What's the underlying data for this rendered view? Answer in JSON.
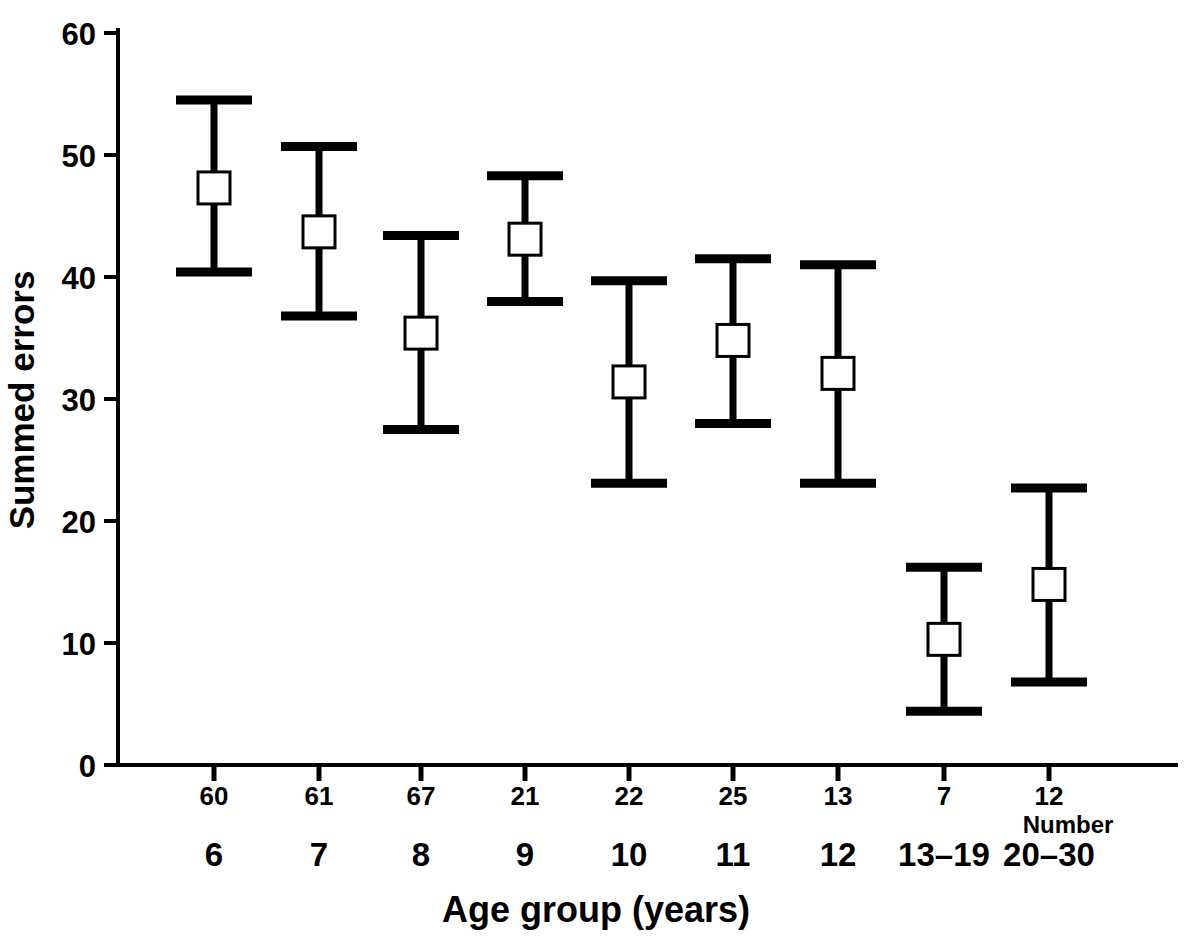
{
  "chart_data": {
    "type": "scatter",
    "title": "",
    "xlabel": "Age group (years)",
    "ylabel": "Summed errors",
    "ylim": [
      0,
      60
    ],
    "yticks": [
      0,
      10,
      20,
      30,
      40,
      50,
      60
    ],
    "ytick_labels": [
      "0",
      "10",
      "20",
      "30",
      "40",
      "50",
      "60"
    ],
    "grid": false,
    "legend": null,
    "error_bar_style": "mean with capped range bars; open square marker at mean",
    "categories": [
      "6",
      "7",
      "8",
      "9",
      "10",
      "11",
      "12",
      "13–19",
      "20–30"
    ],
    "counts_label": "Number",
    "counts": [
      60,
      61,
      67,
      21,
      22,
      25,
      13,
      7,
      12
    ],
    "series": [
      {
        "name": "Summed errors",
        "values": [
          47.3,
          43.7,
          35.4,
          43.1,
          31.4,
          34.8,
          32.1,
          10.3,
          14.8
        ],
        "upper": [
          54.5,
          50.7,
          43.4,
          48.3,
          39.7,
          41.5,
          41.0,
          16.2,
          22.7
        ],
        "lower": [
          40.4,
          36.8,
          27.5,
          38.0,
          23.1,
          28.0,
          23.1,
          4.4,
          6.8
        ]
      }
    ]
  },
  "axes": {
    "y_title": "Summed errors",
    "x_title": "Age group (years)",
    "y_tick_text": [
      "60",
      "50",
      "40",
      "30",
      "20",
      "10",
      "0"
    ],
    "number_note": "Number"
  }
}
